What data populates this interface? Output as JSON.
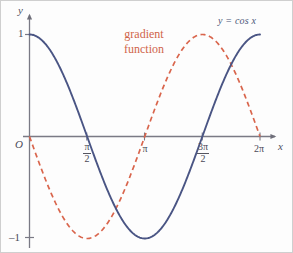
{
  "figure": {
    "name": "cosine-and-gradient-function-graph",
    "background_color": "#fdfdfd",
    "border_color": "#cfcfcf"
  },
  "axes": {
    "y_axis_label": "y",
    "x_axis_label": "x",
    "origin_label": "O",
    "y_tick_labels": [
      "1",
      "–1"
    ],
    "y_tick_values": [
      1,
      -1
    ],
    "x_tick_labels": [
      {
        "numerator": "π",
        "denominator": "2",
        "plain": "π/2"
      },
      {
        "numerator": "π",
        "denominator": "",
        "plain": "π"
      },
      {
        "numerator": "3π",
        "denominator": "2",
        "plain": "3π/2"
      },
      {
        "numerator": "2π",
        "denominator": "",
        "plain": "2π"
      }
    ],
    "axis_color": "#7a7a85"
  },
  "annotations": {
    "cos_curve_label": "y = cos x",
    "gradient_label_line1": "gradient",
    "gradient_label_line2": "function"
  },
  "colors": {
    "cos_curve": "#4a5584",
    "gradient_curve": "#d9654c",
    "label_text": "#4a4a58",
    "gradient_text": "#d0644a"
  },
  "chart_data": {
    "type": "line",
    "title": "",
    "subtitle": "",
    "xlabel": "x",
    "ylabel": "y",
    "xlim": [
      0,
      6.283185307179586
    ],
    "ylim": [
      -1,
      1
    ],
    "grid": false,
    "legend_position": "inline-annotation",
    "x_ticks": [
      1.5707963267948966,
      3.141592653589793,
      4.71238898038469,
      6.283185307179586
    ],
    "x_tick_labels": [
      "π/2",
      "π",
      "3π/2",
      "2π"
    ],
    "y_ticks": [
      1,
      -1
    ],
    "y_tick_labels": [
      "1",
      "–1"
    ],
    "series": [
      {
        "name": "y = cos x",
        "label": "y = cos x",
        "style": "solid",
        "color": "#4a5584",
        "formula": "cos(x)",
        "x": [
          0,
          0.3141592653589793,
          0.6283185307179586,
          0.9424777960769379,
          1.2566370614359172,
          1.5707963267948966,
          1.8849555921538759,
          2.199114857512855,
          2.5132741228718345,
          2.827433388230814,
          3.141592653589793,
          3.4557519189487724,
          3.7699111843077517,
          4.084070449666731,
          4.39822971502571,
          4.71238898038469,
          5.026548245743669,
          5.340707511102648,
          5.654866776461628,
          5.969026041820607,
          6.283185307179586
        ],
        "y": [
          1,
          0.951,
          0.809,
          0.588,
          0.309,
          0,
          -0.309,
          -0.588,
          -0.809,
          -0.951,
          -1,
          -0.951,
          -0.809,
          -0.588,
          -0.309,
          0,
          0.309,
          0.588,
          0.809,
          0.951,
          1
        ]
      },
      {
        "name": "gradient function",
        "label": "gradient function",
        "style": "dashed",
        "color": "#d9654c",
        "formula": "-sin(x)",
        "x": [
          0,
          0.3141592653589793,
          0.6283185307179586,
          0.9424777960769379,
          1.2566370614359172,
          1.5707963267948966,
          1.8849555921538759,
          2.199114857512855,
          2.5132741228718345,
          2.827433388230814,
          3.141592653589793,
          3.4557519189487724,
          3.7699111843077517,
          4.084070449666731,
          4.39822971502571,
          4.71238898038469,
          5.026548245743669,
          5.340707511102648,
          5.654866776461628,
          5.969026041820607,
          6.283185307179586
        ],
        "y": [
          0,
          -0.309,
          -0.588,
          -0.809,
          -0.951,
          -1,
          -0.951,
          -0.809,
          -0.588,
          -0.309,
          0,
          0.309,
          0.588,
          0.809,
          0.951,
          1,
          0.951,
          0.809,
          0.588,
          0.309,
          0
        ]
      }
    ]
  }
}
